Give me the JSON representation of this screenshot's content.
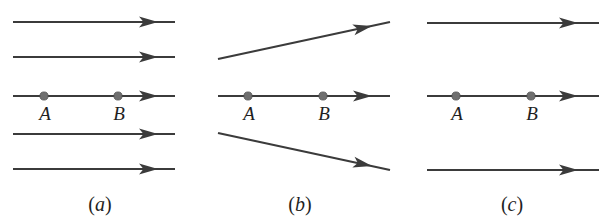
{
  "figure": {
    "background_color": "#ffffff",
    "line_color": "#3b3b3b",
    "dot_color": "#6f6f6f",
    "label_color": "#1f1f1f"
  },
  "panels": [
    {
      "id": "a",
      "caption_open": "(",
      "caption_letter": "a",
      "caption_close": ")",
      "caption_x": 100,
      "caption_y": 211,
      "pattern": "uniform parallel field lines, evenly spaced",
      "lines": [
        {
          "x1": 13,
          "y1": 22,
          "x2": 175,
          "y2": 22,
          "arrow_x": 158,
          "arrow_y": 22,
          "angle": 0
        },
        {
          "x1": 13,
          "y1": 57,
          "x2": 175,
          "y2": 57,
          "arrow_x": 158,
          "arrow_y": 57,
          "angle": 0
        },
        {
          "x1": 13,
          "y1": 96,
          "x2": 175,
          "y2": 96,
          "arrow_x": 158,
          "arrow_y": 96,
          "angle": 0
        },
        {
          "x1": 13,
          "y1": 134,
          "x2": 175,
          "y2": 134,
          "arrow_x": 158,
          "arrow_y": 134,
          "angle": 0
        },
        {
          "x1": 13,
          "y1": 169,
          "x2": 175,
          "y2": 169,
          "arrow_x": 158,
          "arrow_y": 169,
          "angle": 0
        }
      ],
      "points": [
        {
          "label": "A",
          "dot_x": 44,
          "dot_y": 96,
          "label_x": 45,
          "label_y": 120
        },
        {
          "label": "B",
          "dot_x": 118,
          "dot_y": 96,
          "label_x": 119,
          "label_y": 120
        }
      ]
    },
    {
      "id": "b",
      "caption_open": "(",
      "caption_letter": "b",
      "caption_close": ")",
      "caption_x": 300,
      "caption_y": 211,
      "pattern": "diverging field lines, spacing increases to the right",
      "lines": [
        {
          "x1": 218,
          "y1": 59,
          "x2": 390,
          "y2": 22,
          "arrow_x": 372,
          "arrow_y": 25.9,
          "angle": -12.1
        },
        {
          "x1": 218,
          "y1": 96,
          "x2": 390,
          "y2": 96,
          "arrow_x": 372,
          "arrow_y": 96,
          "angle": 0
        },
        {
          "x1": 218,
          "y1": 133,
          "x2": 390,
          "y2": 170,
          "arrow_x": 372,
          "arrow_y": 166.1,
          "angle": 12.1
        }
      ],
      "points": [
        {
          "label": "A",
          "dot_x": 248,
          "dot_y": 96,
          "label_x": 249,
          "label_y": 120
        },
        {
          "label": "B",
          "dot_x": 323,
          "dot_y": 96,
          "label_x": 324,
          "label_y": 120
        }
      ]
    },
    {
      "id": "c",
      "caption_open": "(",
      "caption_letter": "c",
      "caption_close": ")",
      "caption_x": 512,
      "caption_y": 211,
      "pattern": "uniform parallel field lines, widely spaced",
      "lines": [
        {
          "x1": 427,
          "y1": 23,
          "x2": 599,
          "y2": 23,
          "arrow_x": 578,
          "arrow_y": 23,
          "angle": 0
        },
        {
          "x1": 427,
          "y1": 96,
          "x2": 599,
          "y2": 96,
          "arrow_x": 578,
          "arrow_y": 96,
          "angle": 0
        },
        {
          "x1": 427,
          "y1": 170,
          "x2": 599,
          "y2": 170,
          "arrow_x": 578,
          "arrow_y": 170,
          "angle": 0
        }
      ],
      "points": [
        {
          "label": "A",
          "dot_x": 456,
          "dot_y": 96,
          "label_x": 457,
          "label_y": 120
        },
        {
          "label": "B",
          "dot_x": 531,
          "dot_y": 96,
          "label_x": 532,
          "label_y": 120
        }
      ]
    }
  ]
}
